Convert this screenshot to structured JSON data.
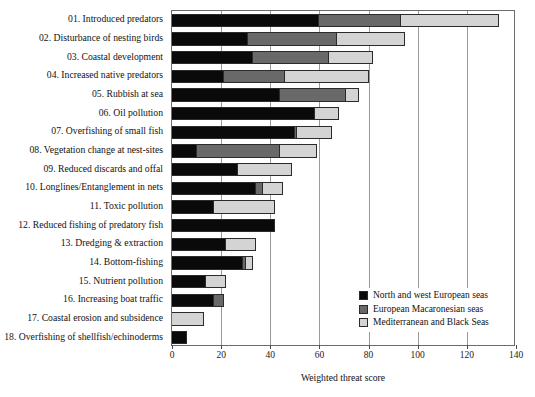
{
  "chart_data": {
    "type": "bar",
    "orientation": "horizontal",
    "stacked": true,
    "title": "",
    "xlabel": "Weighted threat score",
    "ylabel": "",
    "xlim": [
      0,
      140
    ],
    "xticks": [
      0,
      20,
      40,
      60,
      80,
      100,
      120,
      140
    ],
    "grid": true,
    "legend_position": "bottom-right",
    "categories": [
      "01. Introduced predators",
      "02. Disturbance of nesting birds",
      "03. Coastal development",
      "04. Increased native predators",
      "05. Rubbish at sea",
      "06. Oil pollution",
      "07. Overfishing of small fish",
      "08. Vegetation change at nest-sites",
      "09. Reduced discards and offal",
      "10. Longlines/Entanglement in nets",
      "11. Toxic pollution",
      "12. Reduced fishing of predatory fish",
      "13. Dredging & extraction",
      "14. Bottom-fishing",
      "15. Nutrient pollution",
      "16. Increasing boat traffic",
      "17. Coastal erosion and subsidence",
      "18. Overfishing of shellfish/echinoderms"
    ],
    "series": [
      {
        "name": "North and west European seas",
        "color": "#0a0a0a",
        "values": [
          60,
          31,
          33,
          21,
          44,
          58,
          50,
          10,
          27,
          34,
          17,
          42,
          22,
          29,
          14,
          17,
          0,
          6
        ]
      },
      {
        "name": "European Macaronesian seas",
        "color": "#696969",
        "values": [
          33,
          36,
          31,
          25,
          27,
          0,
          1,
          34,
          0,
          3,
          0,
          0,
          0,
          1,
          0,
          4,
          0,
          0
        ]
      },
      {
        "name": "Mediterranean and Black Seas",
        "color": "#d4d4d4",
        "values": [
          40,
          28,
          18,
          34,
          5,
          10,
          14,
          15,
          22,
          8,
          25,
          0,
          12,
          3,
          8,
          0,
          13,
          0
        ]
      }
    ],
    "totals": [
      133,
      95,
      82,
      80,
      76,
      68,
      65,
      59,
      49,
      45,
      42,
      42,
      34,
      33,
      22,
      21,
      13,
      6
    ]
  },
  "axis": {
    "tick_labels": [
      "0",
      "20",
      "40",
      "60",
      "80",
      "100",
      "120",
      "140"
    ],
    "x_title": "Weighted threat score"
  },
  "legend": {
    "items": [
      {
        "label": "North and west European seas",
        "swatch": "legend-swatch-black"
      },
      {
        "label": "European Macaronesian seas",
        "swatch": "legend-swatch-gray"
      },
      {
        "label": "Mediterranean and Black Seas",
        "swatch": "legend-swatch-lightgray"
      }
    ]
  },
  "colors": {
    "series_1": "#0a0a0a",
    "series_2": "#696969",
    "series_3": "#d4d4d4",
    "grid": "#9a9a9a",
    "axis": "#6b6b6b",
    "background": "#ffffff"
  }
}
